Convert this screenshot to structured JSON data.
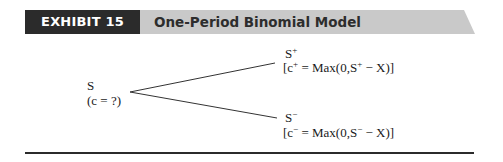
{
  "header": {
    "exhibit_label": "EXHIBIT 15",
    "title": "One-Period Binomial Model",
    "colors": {
      "tag_background": "#2b2b2b",
      "tag_text": "#ffffff",
      "title_bar_background": "#c9c9c9",
      "title_text": "#2d2d2d"
    }
  },
  "tree": {
    "root": {
      "price_label": "S",
      "value_label": "(c = ?)"
    },
    "up": {
      "price_base": "S",
      "price_sup": "+",
      "payoff_open": "[c",
      "payoff_sup": "+",
      "payoff_mid": " = Max(0,S",
      "payoff_sup2": "+",
      "payoff_close": " − X)]"
    },
    "down": {
      "price_base": "S",
      "price_sup": "−",
      "payoff_open": "[c",
      "payoff_sup": "−",
      "payoff_mid": " = Max(0,S",
      "payoff_sup2": "−",
      "payoff_close": " − X)]"
    }
  },
  "footer": {
    "rule_color": "#2b2b2b"
  }
}
